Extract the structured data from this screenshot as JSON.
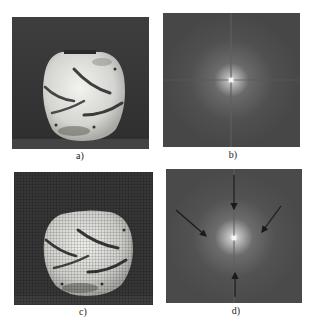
{
  "figure": {
    "panels": [
      {
        "id": "a",
        "label": "a)",
        "content": "original vase photograph",
        "background": "#3a3a3a",
        "vase_color": "#d8d8d4"
      },
      {
        "id": "b",
        "label": "b)",
        "content": "Fourier magnitude spectrum of original",
        "background": "#4a4a4a",
        "center_glow": "#f0f0f0"
      },
      {
        "id": "c",
        "label": "c)",
        "content": "vase photograph with periodic halftone/moire pattern",
        "background": "#363636",
        "vase_color": "#d2d2ce"
      },
      {
        "id": "d",
        "label": "d)",
        "content": "Fourier spectrum with arrows marking periodic-noise peaks",
        "background": "#4c4c4c",
        "center_glow": "#f0f0f0",
        "arrows": [
          {
            "name": "top",
            "direction": "down"
          },
          {
            "name": "left",
            "direction": "down-right"
          },
          {
            "name": "right",
            "direction": "down-left"
          },
          {
            "name": "bottom",
            "direction": "up"
          }
        ],
        "arrow_color": "#1a1a1a"
      }
    ]
  }
}
